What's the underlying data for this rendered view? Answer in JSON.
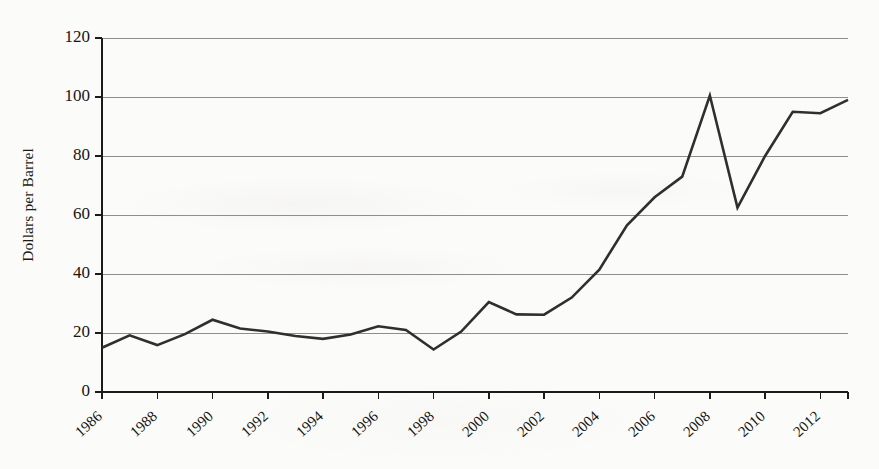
{
  "figure": {
    "background_color": "#fbfbf9",
    "line_color": "#2f2f2f",
    "grid_color": "#8e8e8e",
    "axis_color": "#1b1b1b"
  },
  "chart_data": {
    "type": "line",
    "title": "",
    "xlabel": "",
    "ylabel": "Dollars per Barrel",
    "xlim": [
      1986,
      2013
    ],
    "ylim": [
      0,
      120
    ],
    "ytick_values": [
      0,
      20,
      40,
      60,
      80,
      100,
      120
    ],
    "ytick_labels": [
      "0",
      "20",
      "40",
      "60",
      "80",
      "100",
      "120"
    ],
    "xtick_values": [
      1986,
      1988,
      1990,
      1992,
      1994,
      1996,
      1998,
      2000,
      2002,
      2004,
      2006,
      2008,
      2010,
      2012
    ],
    "xtick_labels": [
      "1986",
      "1988",
      "1990",
      "1992",
      "1994",
      "1996",
      "1998",
      "2000",
      "2002",
      "2004",
      "2006",
      "2008",
      "2010",
      "2012"
    ],
    "grid": "horizontal",
    "legend": "none",
    "x": [
      1986,
      1987,
      1988,
      1989,
      1990,
      1991,
      1992,
      1993,
      1994,
      1995,
      1996,
      1997,
      1998,
      1999,
      2000,
      2001,
      2002,
      2003,
      2004,
      2005,
      2006,
      2007,
      2008,
      2009,
      2010,
      2011,
      2012,
      2013
    ],
    "series": [
      {
        "name": "Crude Oil Price",
        "values": [
          15.0,
          19.2,
          15.9,
          19.6,
          24.5,
          21.5,
          20.5,
          19.0,
          18.0,
          19.5,
          22.3,
          21.0,
          14.4,
          20.5,
          30.5,
          26.3,
          26.2,
          32.0,
          41.5,
          56.5,
          66.0,
          73.0,
          100.5,
          62.5,
          80.0,
          95.0,
          94.5,
          99.0
        ]
      }
    ]
  }
}
